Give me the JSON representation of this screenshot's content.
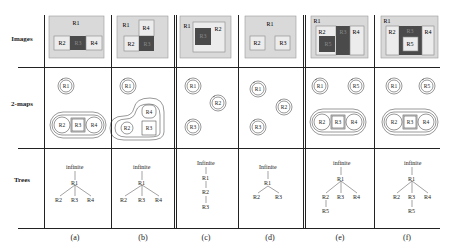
{
  "row_labels": [
    "Images",
    "2-maps",
    "Trees"
  ],
  "columns": [
    {
      "caption": "(a)",
      "image": {
        "outer": "R1",
        "regions": [
          "R2",
          "R3",
          "R4"
        ],
        "dark": [
          "R3"
        ]
      },
      "maps": {
        "isolated": [
          "R1"
        ],
        "chain": [
          "R2",
          "R3",
          "R4"
        ]
      },
      "tree": {
        "root": "infinite",
        "level1": [
          "R1"
        ],
        "level2": [
          "R2",
          "R3",
          "R4"
        ],
        "level3": []
      }
    },
    {
      "caption": "(b)",
      "image": {
        "outer": "R1",
        "regions": [
          "R4",
          "R2",
          "R3"
        ],
        "dark": [
          "R3"
        ]
      },
      "maps": {
        "isolated": [
          "R1"
        ],
        "cluster": [
          "R4",
          "R2",
          "R3"
        ]
      },
      "tree": {
        "root": "infinite",
        "level1": [
          "R1"
        ],
        "level2": [
          "R2",
          "R3",
          "R4"
        ],
        "level3": []
      }
    },
    {
      "caption": "(c)",
      "image": {
        "outer": "R1",
        "regions": [
          "R2",
          "R3"
        ],
        "dark": [
          "R3"
        ]
      },
      "maps": {
        "isolated": [
          "R1",
          "R2",
          "R3"
        ]
      },
      "tree": {
        "root": "Infinite",
        "chain": [
          "R1",
          "R2",
          "R3"
        ]
      }
    },
    {
      "caption": "(d)",
      "image": {
        "outer": "R1",
        "regions": [
          "R2",
          "R3"
        ],
        "dark": []
      },
      "maps": {
        "isolated": [
          "R1",
          "R2",
          "R3"
        ]
      },
      "tree": {
        "root": "Infinite",
        "level1": [
          "R1"
        ],
        "level2": [
          "R2",
          "R3"
        ],
        "level3": []
      }
    },
    {
      "caption": "(e)",
      "image": {
        "outer": "R1",
        "regions": [
          "R2",
          "R3",
          "R4",
          "R5"
        ],
        "dark": [
          "R3",
          "R5"
        ]
      },
      "maps": {
        "isolated": [
          "R1",
          "R5"
        ],
        "chain": [
          "R2",
          "R3",
          "R4"
        ]
      },
      "tree": {
        "root": "infinite",
        "level1": [
          "R1"
        ],
        "level2": [
          "R2",
          "R3",
          "R4"
        ],
        "level3": [
          "R5"
        ]
      }
    },
    {
      "caption": "(f)",
      "image": {
        "outer": "R1",
        "regions": [
          "R2",
          "R3",
          "R4",
          "R5"
        ],
        "dark": [
          "R3"
        ]
      },
      "maps": {
        "isolated": [
          "R1",
          "R5"
        ],
        "chain": [
          "R2",
          "R3",
          "R4"
        ]
      },
      "tree": {
        "root": "infinite",
        "level1": [
          "R1"
        ],
        "level2": [
          "R2",
          "R3",
          "R4"
        ],
        "level3": [
          "R5"
        ]
      }
    }
  ],
  "colors": {
    "light": "#d9d9d9",
    "inner": "#ececec",
    "dark": "#4a4a4a",
    "line": "#222222"
  }
}
